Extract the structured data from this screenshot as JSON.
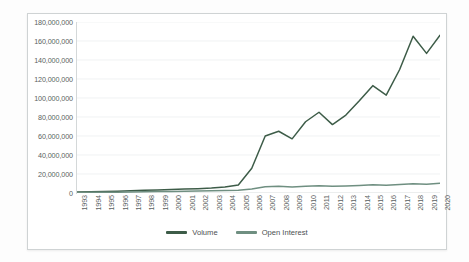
{
  "chart_data": {
    "type": "line",
    "title": "",
    "xlabel": "",
    "ylabel": "",
    "ylim": [
      0,
      180000000
    ],
    "ytick_step": 20000000,
    "grid": true,
    "legend_position": "bottom",
    "x": [
      "1993",
      "1994",
      "1995",
      "1996",
      "1997",
      "1998",
      "1999",
      "2000",
      "2001",
      "2002",
      "2003",
      "2004",
      "2005",
      "2006",
      "2007",
      "2008",
      "2009",
      "2010",
      "2011",
      "2012",
      "2013",
      "2014",
      "2015",
      "2016",
      "2017",
      "2018",
      "2019",
      "2020"
    ],
    "ytick_labels": [
      "0",
      "20,000,000",
      "40,000,000",
      "60,000,000",
      "80,000,000",
      "100,000,000",
      "120,000,000",
      "140,000,000",
      "160,000,000",
      "180,000,000"
    ],
    "ytick_values": [
      0,
      20000000,
      40000000,
      60000000,
      80000000,
      100000000,
      120000000,
      140000000,
      160000000,
      180000000
    ],
    "series": [
      {
        "name": "Volume",
        "color": "#3d5c48",
        "values": [
          1000000,
          1300000,
          1600000,
          1900000,
          2300000,
          2800000,
          3200000,
          3800000,
          4200000,
          4600000,
          5200000,
          6200000,
          8500000,
          26000000,
          60000000,
          65000000,
          57000000,
          75000000,
          85000000,
          72000000,
          82000000,
          97000000,
          113000000,
          103000000,
          130000000,
          165000000,
          147000000,
          166000000
        ]
      },
      {
        "name": "Open Interest",
        "color": "#6f8f81",
        "values": [
          500000,
          700000,
          800000,
          900000,
          1100000,
          1300000,
          1500000,
          1700000,
          1900000,
          2100000,
          2300000,
          2600000,
          3000000,
          4200000,
          6500000,
          7000000,
          6200000,
          7200000,
          7600000,
          7000000,
          7400000,
          8000000,
          8600000,
          8200000,
          9000000,
          9800000,
          9300000,
          10200000
        ]
      }
    ]
  },
  "legend": {
    "items": [
      {
        "label": "Volume",
        "color": "#3d5c48"
      },
      {
        "label": "Open Interest",
        "color": "#6f8f81"
      }
    ]
  }
}
